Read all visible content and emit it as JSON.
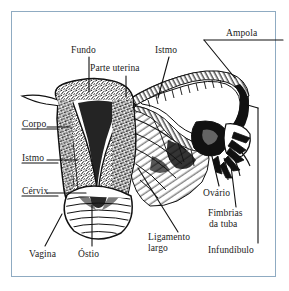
{
  "figure": {
    "language": "pt-BR",
    "border_color": "#8fabc2",
    "ink_color": "#111111",
    "background_color": "#ffffff"
  },
  "labels": {
    "fundo": "Fundo",
    "parte_uterina": "Parte uterina",
    "istmo_tuba": "Istmo",
    "ampola": "Ampola",
    "corpo": "Corpo",
    "istmo_utero": "Istmo",
    "cervix": "Cérvix",
    "vagina": "Vagina",
    "ostio": "Óstio",
    "ligamento_largo_l1": "Ligamento",
    "ligamento_largo_l2": "largo",
    "ovario": "Ovário",
    "fimbrias_l1": "Fimbrias",
    "fimbrias_l2": "da tuba",
    "infundibulo": "Infundíbulo"
  },
  "structures": [
    {
      "name": "fundo-do-utero",
      "label": "Fundo"
    },
    {
      "name": "parte-uterina-da-tuba",
      "label": "Parte uterina"
    },
    {
      "name": "istmo-da-tuba",
      "label": "Istmo"
    },
    {
      "name": "ampola-da-tuba",
      "label": "Ampola"
    },
    {
      "name": "corpo-do-utero",
      "label": "Corpo"
    },
    {
      "name": "istmo-do-utero",
      "label": "Istmo"
    },
    {
      "name": "cervix",
      "label": "Cérvix"
    },
    {
      "name": "vagina",
      "label": "Vagina"
    },
    {
      "name": "ostio-do-utero",
      "label": "Óstio"
    },
    {
      "name": "ligamento-largo",
      "label": "Ligamento largo"
    },
    {
      "name": "ovario",
      "label": "Ovário"
    },
    {
      "name": "fimbrias-da-tuba",
      "label": "Fimbrias da tuba"
    },
    {
      "name": "infundibulo",
      "label": "Infundíbulo"
    }
  ]
}
